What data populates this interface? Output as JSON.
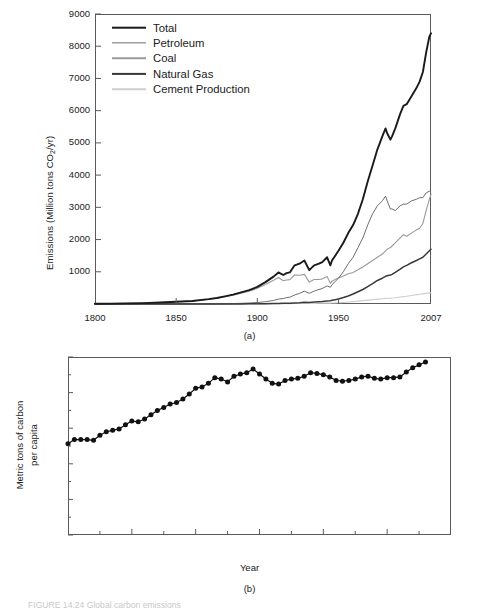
{
  "figure": {
    "caption_fragment": "FIGURE 14.24   Global carbon emissions",
    "panel_a_label": "(a)",
    "panel_b_label": "(b)"
  },
  "colors": {
    "total": "#1a1a1a",
    "petroleum": "#6e6e6e",
    "coal": "#9a9a9a",
    "natural_gas": "#3a3a3a",
    "cement": "#cfcfcf",
    "axis": "#5a5a5a",
    "marker": "#111111"
  },
  "panel_a": {
    "legend": [
      {
        "label": "Total",
        "color_key": "total",
        "width": 2.6
      },
      {
        "label": "Petroleum",
        "color_key": "petroleum",
        "width": 1.3
      },
      {
        "label": "Coal",
        "color_key": "coal",
        "width": 1.5
      },
      {
        "label": "Natural Gas",
        "color_key": "natural_gas",
        "width": 2.2
      },
      {
        "label": "Cement Production",
        "color_key": "cement",
        "width": 1.5
      }
    ],
    "ylabel": "Emissions (Million tons CO",
    "ylabel_sub": "2",
    "ylabel_tail": "/yr)",
    "y_ticks": [
      "9000",
      "8000",
      "7000",
      "6000",
      "5000",
      "4000",
      "3000",
      "2000",
      "1000"
    ],
    "x_ticks": [
      "1800",
      "1850",
      "1900",
      "1950",
      "2007"
    ]
  },
  "panel_b": {
    "ylabel_line1": "Metric tons of carbon",
    "ylabel_line2": "per capita",
    "xlabel": "Year",
    "y_ticks": [
      "1.25",
      "1.00",
      "0.75",
      "0.50",
      "0.25",
      "0.00"
    ],
    "x_ticks": [
      "1950",
      "1960",
      "1970",
      "1980",
      "1990",
      "2000",
      "2010"
    ]
  },
  "chart_data": [
    {
      "type": "line",
      "title": "Global CO2 emissions by source",
      "xlabel": "",
      "ylabel": "Emissions (Million tons CO2/yr)",
      "xlim": [
        1800,
        2007
      ],
      "ylim": [
        0,
        9000
      ],
      "grid": false,
      "legend_position": "upper-left",
      "xticks": [
        1800,
        1850,
        1900,
        1950,
        2007
      ],
      "yticks": [
        1000,
        2000,
        3000,
        4000,
        5000,
        6000,
        7000,
        8000,
        9000
      ],
      "x": [
        1800,
        1810,
        1820,
        1830,
        1840,
        1850,
        1860,
        1870,
        1875,
        1880,
        1885,
        1890,
        1895,
        1900,
        1905,
        1910,
        1913,
        1916,
        1918,
        1920,
        1923,
        1926,
        1929,
        1932,
        1935,
        1938,
        1940,
        1943,
        1945,
        1946,
        1948,
        1950,
        1953,
        1956,
        1959,
        1962,
        1965,
        1968,
        1971,
        1974,
        1977,
        1979,
        1980,
        1982,
        1983,
        1985,
        1988,
        1990,
        1992,
        1995,
        1998,
        2000,
        2002,
        2004,
        2006,
        2007
      ],
      "series": [
        {
          "name": "Total",
          "color": "#1a1a1a",
          "values": [
            8,
            12,
            18,
            28,
            45,
            70,
            95,
            150,
            185,
            235,
            290,
            360,
            430,
            530,
            680,
            850,
            980,
            900,
            960,
            980,
            1200,
            1250,
            1350,
            1050,
            1200,
            1250,
            1300,
            1450,
            1200,
            1350,
            1500,
            1650,
            1900,
            2200,
            2450,
            2800,
            3250,
            3800,
            4300,
            4800,
            5200,
            5450,
            5300,
            5100,
            5200,
            5450,
            5900,
            6150,
            6200,
            6450,
            6700,
            6900,
            7200,
            7800,
            8300,
            8400
          ]
        },
        {
          "name": "Petroleum",
          "color": "#6e6e6e",
          "values": [
            0,
            0,
            0,
            0,
            0,
            0,
            0,
            2,
            4,
            8,
            14,
            22,
            32,
            45,
            70,
            110,
            150,
            170,
            200,
            210,
            280,
            330,
            400,
            330,
            400,
            450,
            480,
            560,
            520,
            600,
            700,
            800,
            1000,
            1250,
            1450,
            1750,
            2050,
            2450,
            2800,
            3050,
            3200,
            3350,
            3200,
            2950,
            2950,
            2900,
            3050,
            3100,
            3100,
            3200,
            3250,
            3300,
            3300,
            3450,
            3500,
            3450
          ]
        },
        {
          "name": "Coal",
          "color": "#9a9a9a",
          "values": [
            8,
            12,
            18,
            28,
            45,
            70,
            95,
            148,
            180,
            227,
            275,
            338,
            398,
            485,
            605,
            735,
            820,
            720,
            745,
            755,
            900,
            890,
            920,
            680,
            760,
            760,
            780,
            850,
            640,
            710,
            760,
            810,
            870,
            940,
            980,
            1060,
            1150,
            1250,
            1350,
            1450,
            1550,
            1650,
            1700,
            1750,
            1800,
            1900,
            2050,
            2150,
            2100,
            2200,
            2300,
            2350,
            2500,
            2900,
            3250,
            3400
          ]
        },
        {
          "name": "Natural Gas",
          "color": "#3a3a3a",
          "values": [
            0,
            0,
            0,
            0,
            0,
            0,
            0,
            0,
            0,
            0,
            1,
            2,
            4,
            6,
            10,
            14,
            18,
            20,
            22,
            24,
            32,
            40,
            52,
            48,
            60,
            70,
            78,
            95,
            100,
            115,
            135,
            155,
            200,
            250,
            310,
            380,
            450,
            540,
            630,
            730,
            800,
            860,
            880,
            900,
            920,
            980,
            1080,
            1150,
            1200,
            1280,
            1350,
            1400,
            1450,
            1550,
            1650,
            1700
          ]
        },
        {
          "name": "Cement Production",
          "color": "#cfcfcf",
          "values": [
            0,
            0,
            0,
            0,
            0,
            0,
            0,
            0,
            0,
            0,
            0,
            0,
            1,
            2,
            4,
            6,
            8,
            8,
            9,
            10,
            14,
            18,
            22,
            16,
            20,
            24,
            26,
            30,
            26,
            30,
            35,
            40,
            50,
            62,
            75,
            90,
            105,
            120,
            135,
            150,
            165,
            175,
            178,
            180,
            185,
            195,
            215,
            230,
            240,
            265,
            290,
            300,
            315,
            330,
            345,
            350
          ]
        }
      ]
    },
    {
      "type": "line",
      "title": "Per-capita carbon emissions",
      "xlabel": "Year",
      "ylabel": "Metric tons of carbon per capita",
      "xlim": [
        1950,
        2010
      ],
      "ylim": [
        0.0,
        1.25
      ],
      "grid": false,
      "markers": "filled-circle",
      "xticks": [
        1950,
        1960,
        1970,
        1980,
        1990,
        2000,
        2010
      ],
      "yticks": [
        0.0,
        0.25,
        0.5,
        0.75,
        1.0,
        1.25
      ],
      "x": [
        1950,
        1951,
        1952,
        1953,
        1954,
        1955,
        1956,
        1957,
        1958,
        1959,
        1960,
        1961,
        1962,
        1963,
        1964,
        1965,
        1966,
        1967,
        1968,
        1969,
        1970,
        1971,
        1972,
        1973,
        1974,
        1975,
        1976,
        1977,
        1978,
        1979,
        1980,
        1981,
        1982,
        1983,
        1984,
        1985,
        1986,
        1987,
        1988,
        1989,
        1990,
        1991,
        1992,
        1993,
        1994,
        1995,
        1996,
        1997,
        1998,
        1999,
        2000,
        2001,
        2002,
        2003,
        2004,
        2005,
        2006
      ],
      "values": [
        0.64,
        0.67,
        0.67,
        0.67,
        0.665,
        0.7,
        0.725,
        0.735,
        0.745,
        0.775,
        0.8,
        0.795,
        0.815,
        0.845,
        0.875,
        0.895,
        0.92,
        0.93,
        0.955,
        0.99,
        1.03,
        1.04,
        1.065,
        1.105,
        1.095,
        1.075,
        1.115,
        1.13,
        1.14,
        1.165,
        1.13,
        1.095,
        1.065,
        1.06,
        1.085,
        1.095,
        1.1,
        1.115,
        1.14,
        1.135,
        1.125,
        1.11,
        1.085,
        1.08,
        1.085,
        1.095,
        1.11,
        1.115,
        1.1,
        1.095,
        1.105,
        1.105,
        1.11,
        1.145,
        1.175,
        1.195,
        1.215
      ]
    }
  ]
}
